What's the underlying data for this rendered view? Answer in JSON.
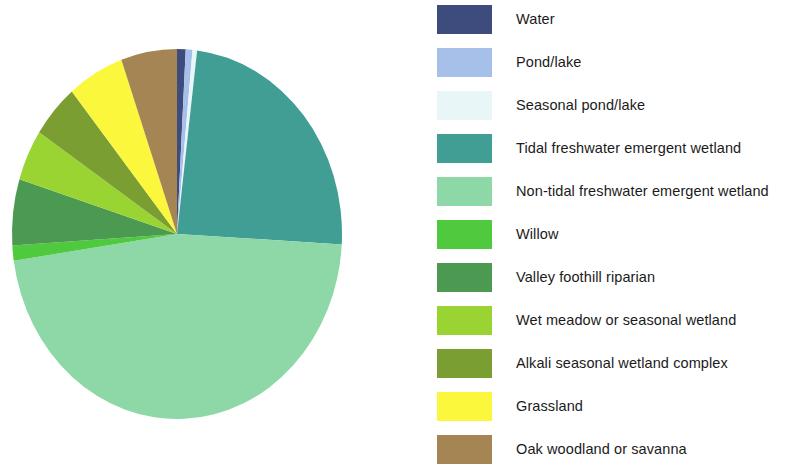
{
  "chart_data": {
    "type": "pie",
    "title": "",
    "subtitle": "",
    "xlabel": "",
    "ylabel": "",
    "legend_position": "right",
    "grid": false,
    "start_angle_deg": 0,
    "direction": "clockwise",
    "categories": [
      "Water",
      "Pond/lake",
      "Seasonal pond/lake",
      "Tidal freshwater emergent wetland",
      "Non-tidal freshwater emergent wetland",
      "Willow",
      "Valley foothill riparian",
      "Wet meadow or seasonal wetland",
      "Alkali seasonal wetland complex",
      "Grassland",
      "Oak woodland or savanna"
    ],
    "values": [
      0.9,
      0.7,
      0.5,
      25.3,
      49.4,
      1.4,
      6.1,
      4.7,
      5.0,
      5.8,
      5.8
    ],
    "colors": [
      "#3d4c7d",
      "#a6c0ea",
      "#e8f6f8",
      "#419e94",
      "#8dd8a6",
      "#4fc93d",
      "#4c9a52",
      "#9ad433",
      "#7b9e33",
      "#fbf73c",
      "#a58553"
    ],
    "slice_angles_deg": [
      3.2,
      2.5,
      1.7,
      91.0,
      177.8,
      5.0,
      22.0,
      17.0,
      18.0,
      21.0,
      20.8
    ]
  },
  "legend": {
    "items": [
      {
        "label": "Water",
        "color": "#3d4c7d"
      },
      {
        "label": "Pond/lake",
        "color": "#a6c0ea"
      },
      {
        "label": "Seasonal pond/lake",
        "color": "#e8f6f8"
      },
      {
        "label": "Tidal freshwater emergent wetland",
        "color": "#419e94"
      },
      {
        "label": "Non-tidal freshwater emergent wetland",
        "color": "#8dd8a6"
      },
      {
        "label": "Willow",
        "color": "#4fc93d"
      },
      {
        "label": "Valley foothill riparian",
        "color": "#4c9a52"
      },
      {
        "label": "Wet meadow or seasonal wetland",
        "color": "#9ad433"
      },
      {
        "label": "Alkali seasonal wetland complex",
        "color": "#7b9e33"
      },
      {
        "label": "Grassland",
        "color": "#fbf73c"
      },
      {
        "label": "Oak woodland or savanna",
        "color": "#a58553"
      }
    ]
  }
}
